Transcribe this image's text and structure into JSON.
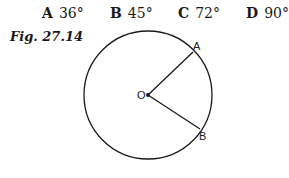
{
  "options": [
    {
      "letter": "A",
      "value": "36°"
    },
    {
      "letter": "B",
      "value": "45°"
    },
    {
      "letter": "C",
      "value": "72°"
    },
    {
      "letter": "D",
      "value": "90°"
    }
  ],
  "figure": {
    "caption": "Fig. 27.14",
    "labels": {
      "center": "O",
      "point_a": "A",
      "point_b": "B"
    },
    "circle": {
      "cx": 148,
      "cy": 95,
      "r": 64
    },
    "stroke_color": "#1a1a1a"
  }
}
